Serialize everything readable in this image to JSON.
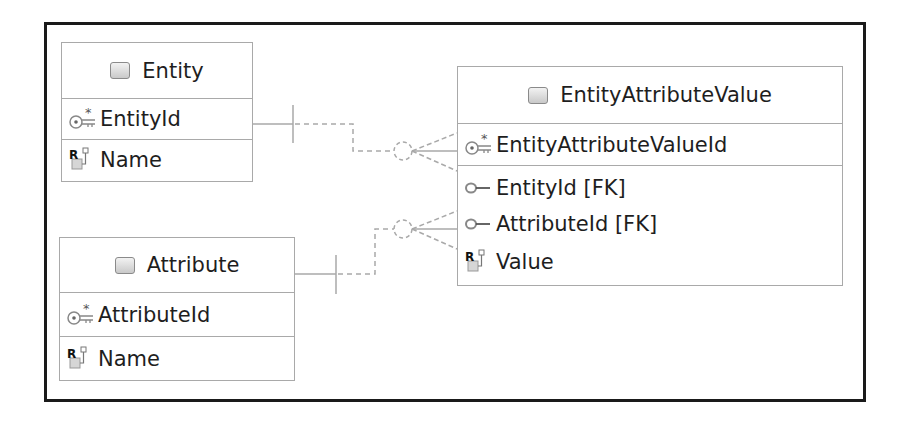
{
  "diagram": {
    "entities": [
      {
        "name": "Entity",
        "attributes": [
          {
            "label": "EntityId",
            "icon": "primary-key-icon"
          },
          {
            "label": "Name",
            "icon": "required-property-icon"
          }
        ]
      },
      {
        "name": "Attribute",
        "attributes": [
          {
            "label": "AttributeId",
            "icon": "primary-key-icon"
          },
          {
            "label": "Name",
            "icon": "required-property-icon"
          }
        ]
      },
      {
        "name": "EntityAttributeValue",
        "attributes": [
          {
            "label": "EntityAttributeValueId",
            "icon": "primary-key-icon"
          },
          {
            "label": "EntityId [FK]",
            "icon": "foreign-key-icon"
          },
          {
            "label": "AttributeId [FK]",
            "icon": "foreign-key-icon"
          },
          {
            "label": "Value",
            "icon": "required-property-icon"
          }
        ]
      }
    ],
    "relationships": [
      {
        "from": "Entity",
        "to": "EntityAttributeValue",
        "from_cardinality": "one",
        "to_cardinality": "zero-or-many"
      },
      {
        "from": "Attribute",
        "to": "EntityAttributeValue",
        "from_cardinality": "one",
        "to_cardinality": "zero-or-many"
      }
    ],
    "colors": {
      "frame": "#1a1a1a",
      "table_border": "#a9a9a9",
      "connector": "#a9a9a9",
      "text": "#1e1e1e"
    }
  }
}
